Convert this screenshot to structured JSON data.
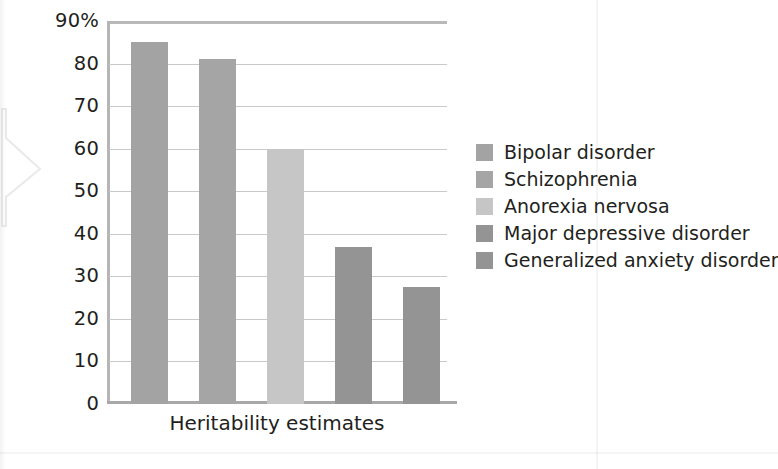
{
  "chart_data": {
    "type": "bar",
    "title": "",
    "subtitle": "",
    "xlabel": "Heritability estimates",
    "ylabel": "",
    "categories": [
      "Bipolar disorder",
      "Schizophrenia",
      "Anorexia nervosa",
      "Major depressive disorder",
      "Generalized anxiety disorder"
    ],
    "values": [
      85,
      81,
      60,
      37,
      27.5
    ],
    "ylim": [
      0,
      90
    ],
    "ytick_labels": [
      "90%",
      "80",
      "70",
      "60",
      "50",
      "40",
      "30",
      "20",
      "10",
      "0"
    ],
    "ytick_values": [
      90,
      80,
      70,
      60,
      50,
      40,
      30,
      20,
      10,
      0
    ],
    "grid": true,
    "legend_position": "right",
    "units": "percent",
    "bar_colors": [
      "#a3a3a3",
      "#a5a5a5",
      "#c6c6c6",
      "#949494",
      "#949494"
    ],
    "legend": [
      {
        "label": "Bipolar disorder",
        "color": "#a3a3a3"
      },
      {
        "label": "Schizophrenia",
        "color": "#a5a5a5"
      },
      {
        "label": "Anorexia nervosa",
        "color": "#c6c6c6"
      },
      {
        "label": "Major depressive disorder",
        "color": "#949494"
      },
      {
        "label": "Generalized anxiety disorder",
        "color": "#949494"
      }
    ]
  },
  "axis": {
    "tick_90": "90%",
    "tick_80": "80",
    "tick_70": "70",
    "tick_60": "60",
    "tick_50": "50",
    "tick_40": "40",
    "tick_30": "30",
    "tick_20": "20",
    "tick_10": "10",
    "tick_0": "0"
  }
}
